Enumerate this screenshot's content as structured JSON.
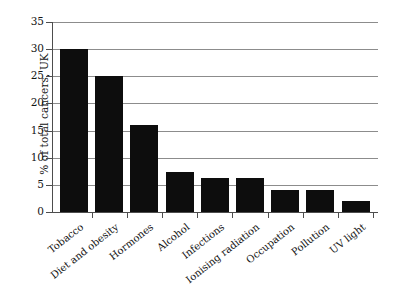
{
  "chart_data": {
    "type": "bar",
    "title": "",
    "subtitle": "",
    "xlabel": "",
    "ylabel": "% of total cancers, UK",
    "categories": [
      "Tobacco",
      "Diet and obesity",
      "Hormones",
      "Alcohol",
      "Infections",
      "Ionising radiation",
      "Occupation",
      "Pollution",
      "UV light"
    ],
    "values": [
      30,
      25,
      16,
      7.4,
      6.2,
      6.2,
      4,
      4,
      2
    ],
    "ylim": [
      0,
      35
    ],
    "ytick_labels": [
      "0",
      "5",
      "10",
      "15",
      "20",
      "25",
      "30",
      "35"
    ],
    "ytick_values": [
      0,
      5,
      10,
      15,
      20,
      25,
      30,
      35
    ],
    "grid": true,
    "grid_axis": "y",
    "legend": false,
    "legend_position": "none",
    "bar_color": "#0d0d0d",
    "grid_color": "#8c8c8c",
    "axis_color": "#4d4d4d",
    "background": "#ffffff",
    "annotations": []
  }
}
